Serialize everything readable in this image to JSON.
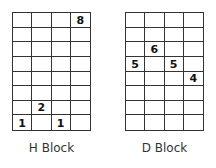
{
  "blocks": [
    {
      "label": "H Block",
      "cols": 4,
      "rows": 8,
      "cells": [
        [
          "",
          "",
          "",
          "8"
        ],
        [
          "",
          "",
          "",
          ""
        ],
        [
          "",
          "",
          "",
          ""
        ],
        [
          "",
          "",
          "",
          ""
        ],
        [
          "",
          "",
          "",
          ""
        ],
        [
          "",
          "",
          "",
          ""
        ],
        [
          "",
          "2",
          "",
          ""
        ],
        [
          "1",
          "",
          "1",
          ""
        ]
      ]
    },
    {
      "label": "D Block",
      "cols": 4,
      "rows": 8,
      "cells": [
        [
          "",
          "",
          "",
          ""
        ],
        [
          "",
          "",
          "",
          ""
        ],
        [
          "",
          "6",
          "",
          ""
        ],
        [
          "5",
          "",
          "5",
          ""
        ],
        [
          "",
          "",
          "",
          "4"
        ],
        [
          "",
          "",
          "",
          ""
        ],
        [
          "",
          "",
          "",
          ""
        ],
        [
          "",
          "",
          "",
          ""
        ]
      ]
    }
  ]
}
